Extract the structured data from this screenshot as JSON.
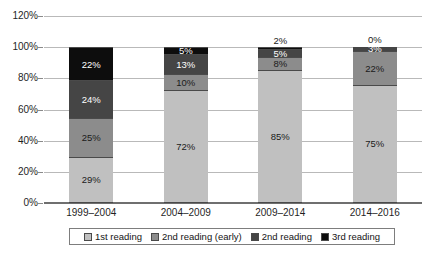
{
  "chart_data": {
    "type": "bar",
    "subtype": "stacked-100-percent",
    "title": "",
    "xlabel": "",
    "ylabel": "",
    "ylim": [
      0,
      120
    ],
    "yticks": [
      "0%",
      "20%",
      "40%",
      "60%",
      "80%",
      "100%",
      "120%"
    ],
    "ytick_values": [
      0,
      20,
      40,
      60,
      80,
      100,
      120
    ],
    "grid": true,
    "legend_position": "bottom",
    "categories": [
      "1999–2004",
      "2004–2009",
      "2009–2014",
      "2014–2016"
    ],
    "series": [
      {
        "name": "1st reading",
        "color": "#c0c0c0",
        "values": [
          29,
          72,
          85,
          75
        ],
        "labels": [
          "29%",
          "72%",
          "85%",
          "75%"
        ],
        "label_colors": [
          "#1a1a1a",
          "#1a1a1a",
          "#1a1a1a",
          "#1a1a1a"
        ]
      },
      {
        "name": "2nd reading (early)",
        "color": "#8c8c8c",
        "values": [
          25,
          10,
          8,
          22
        ],
        "labels": [
          "25%",
          "10%",
          "8%",
          "22%"
        ],
        "label_colors": [
          "#1a1a1a",
          "#1a1a1a",
          "#1a1a1a",
          "#1a1a1a"
        ]
      },
      {
        "name": "2nd reading",
        "color": "#454545",
        "values": [
          24,
          13,
          5,
          3
        ],
        "labels": [
          "24%",
          "13%",
          "5%",
          "3%"
        ],
        "label_colors": [
          "#ffffff",
          "#ffffff",
          "#ffffff",
          "#ffffff"
        ]
      },
      {
        "name": "3rd reading",
        "color": "#0d0d0d",
        "values": [
          22,
          5,
          2,
          0
        ],
        "labels": [
          "22%",
          "5%",
          "2%",
          "0%"
        ],
        "label_colors": [
          "#ffffff",
          "#ffffff",
          "#1a1a1a",
          "#1a1a1a"
        ],
        "label_outside": [
          false,
          false,
          true,
          true
        ]
      }
    ]
  },
  "legend": {
    "items": [
      {
        "label": "1st reading",
        "color": "#c0c0c0"
      },
      {
        "label": "2nd reading (early)",
        "color": "#8c8c8c"
      },
      {
        "label": "2nd reading",
        "color": "#454545"
      },
      {
        "label": "3rd reading",
        "color": "#0d0d0d"
      }
    ]
  }
}
